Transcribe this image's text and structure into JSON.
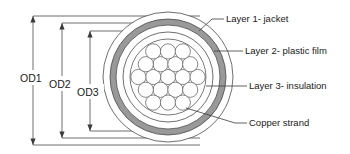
{
  "diagram": {
    "background_color": "#ffffff",
    "line_color": "#3a3a3a",
    "center": {
      "x": 168,
      "y": 77
    },
    "dimensions": [
      {
        "id": "od1",
        "label": "OD1",
        "label_x": 30,
        "label_y": 80,
        "axis_x": 33,
        "top_y": 16,
        "bottom_y": 145,
        "ext_right": 200
      },
      {
        "id": "od2",
        "label": "OD2",
        "label_x": 60,
        "label_y": 86,
        "axis_x": 62,
        "top_y": 23,
        "bottom_y": 138,
        "ext_right": 200
      },
      {
        "id": "od3",
        "label": "OD3",
        "label_x": 88,
        "label_y": 94,
        "axis_x": 90,
        "top_y": 31,
        "bottom_y": 131,
        "ext_right": 200
      }
    ],
    "layers": [
      {
        "id": "jacket",
        "name": "Layer 1- jacket",
        "radius": 65,
        "fill": "#ffffff",
        "stroke": "#4a4a4a"
      },
      {
        "id": "film",
        "name": "Layer 2- plastic film",
        "radius": 58,
        "fill": "#999999",
        "stroke": "#4a4a4a"
      },
      {
        "id": "film_in",
        "name": "plastic-film-inner",
        "radius": 52,
        "fill": "#ffffff",
        "stroke": "#4a4a4a"
      },
      {
        "id": "insul",
        "name": "Layer 3- insulation",
        "radius": 45,
        "fill": "#ffffff",
        "stroke": "#4a4a4a"
      },
      {
        "id": "core",
        "name": "copper-core-boundary",
        "radius": 38,
        "fill": "#ffffff",
        "stroke": "#555555"
      }
    ],
    "callouts": [
      {
        "id": "layer1",
        "label": "Layer 1- jacket",
        "text_x": 224,
        "text_y": 22,
        "line_x1": 212,
        "line_y1": 19,
        "hook_x": 199,
        "hook_y": 31
      },
      {
        "id": "layer2",
        "label": "Layer 2- plastic film",
        "text_x": 243,
        "text_y": 54,
        "line_x1": 231,
        "line_y1": 51,
        "hook_x": 214,
        "hook_y": 51
      },
      {
        "id": "layer3",
        "label": "Layer 3- insulation",
        "text_x": 247,
        "text_y": 89,
        "line_x1": 235,
        "line_y1": 86,
        "hook_x": 206,
        "hook_y": 86
      },
      {
        "id": "strand",
        "label": "Copper strand",
        "text_x": 247,
        "text_y": 126,
        "line_x1": 235,
        "line_y1": 123,
        "hook_x": 186,
        "hook_y": 108
      }
    ],
    "copper_strands": {
      "name": "copper-strand-bundle",
      "count": 19,
      "strand_radius": 7.6,
      "positions": [
        [
          168,
          77
        ],
        [
          153.2,
          77
        ],
        [
          182.8,
          77
        ],
        [
          160.6,
          64.2
        ],
        [
          175.4,
          64.2
        ],
        [
          160.6,
          89.8
        ],
        [
          175.4,
          89.8
        ],
        [
          138.4,
          77
        ],
        [
          197.6,
          77
        ],
        [
          145.8,
          64.2
        ],
        [
          190.2,
          64.2
        ],
        [
          145.8,
          89.8
        ],
        [
          190.2,
          89.8
        ],
        [
          153.2,
          51.4
        ],
        [
          168,
          51.4
        ],
        [
          182.8,
          51.4
        ],
        [
          153.2,
          102.6
        ],
        [
          168,
          102.6
        ],
        [
          182.8,
          102.6
        ]
      ]
    }
  }
}
